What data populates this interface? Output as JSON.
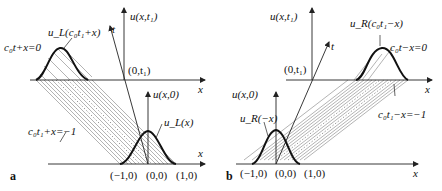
{
  "figure": {
    "panels": [
      {
        "id": "a",
        "panel_label": "a",
        "labels": {
          "u_xt1": "u(x,t₁)",
          "t_axis": "t",
          "point_0_t1": "(0,t₁)",
          "x_upper": "x",
          "u_x0": "u(x,0)",
          "x_lower": "x",
          "moving_wave": "u_L(c₀t₁+x)",
          "line_upper": "c₀t+x=0",
          "line_lower": "c₀t₁+x=−1",
          "initial_wave": "u_L(x)",
          "tick_neg1": "(−1,0)",
          "tick_0": "(0,0)",
          "tick_1": "(1,0)"
        }
      },
      {
        "id": "b",
        "panel_label": "b",
        "labels": {
          "u_xt1": "u(x,t₁)",
          "t_axis": "t",
          "point_0_t1": "(0,t₁)",
          "x_upper": "x",
          "u_x0": "u(x,0)",
          "x_lower": "x",
          "moving_wave": "u_R(c₀t₁−x)",
          "line_upper": "c₀t−x=0",
          "line_lower": "c₀t₁−x=−1",
          "initial_wave": "u_R(−x)",
          "tick_neg1": "(−1,0)",
          "tick_0": "(0,0)",
          "tick_1": "(1,0)"
        }
      }
    ]
  }
}
